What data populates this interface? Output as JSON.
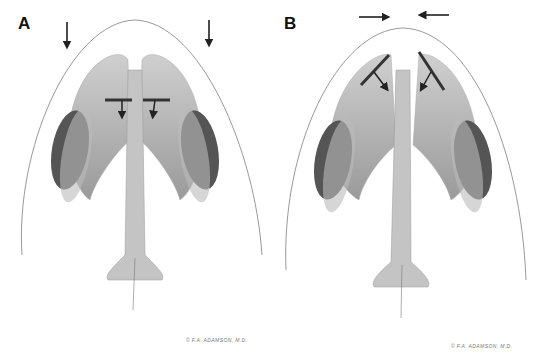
{
  "figure": {
    "panels": [
      {
        "label": "A",
        "description": "Nasal base view with downward arrows above each side and small internal downward arrows",
        "external_arrows": "down",
        "credit": "© F.A. ADAMSON, M.D."
      },
      {
        "label": "B",
        "description": "Nasal base view with converging horizontal arrows and angled internal arrows",
        "external_arrows": "converging",
        "credit": "© F.A. ADAMSON, M.D."
      }
    ],
    "colors": {
      "outline": "#8a8a8a",
      "cartilage_light": "#d9d9d9",
      "cartilage_mid": "#aaaaaa",
      "cartilage_dark": "#555555",
      "arrow": "#222222"
    }
  }
}
